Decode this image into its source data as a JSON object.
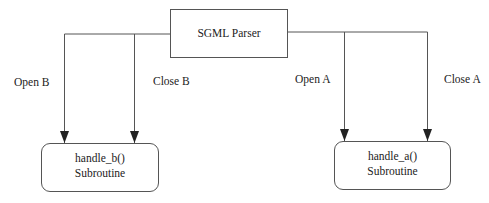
{
  "diagram": {
    "parser": {
      "label": "SGML Parser"
    },
    "handlers": [
      {
        "name": "handle_b()",
        "kind": "Subroutine"
      },
      {
        "name": "handle_a()",
        "kind": "Subroutine"
      }
    ],
    "edges": [
      {
        "from": "SGML Parser",
        "to": "handle_b()",
        "label": "Open B"
      },
      {
        "from": "SGML Parser",
        "to": "handle_b()",
        "label": "Close B"
      },
      {
        "from": "SGML Parser",
        "to": "handle_a()",
        "label": "Open A"
      },
      {
        "from": "SGML Parser",
        "to": "handle_a()",
        "label": "Close A"
      }
    ],
    "colors": {
      "line": "#555555",
      "text": "#222222",
      "background": "#ffffff"
    }
  }
}
